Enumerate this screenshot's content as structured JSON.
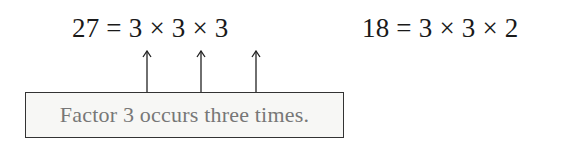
{
  "equations": [
    {
      "text": "27 = 3 × 3 × 3"
    },
    {
      "text": "18 = 3 × 3 × 2"
    }
  ],
  "annotation": {
    "label": "Factor 3 occurs three times.",
    "arrow_count": 3,
    "points_to": "each factor 3 in 27 = 3 × 3 × 3"
  },
  "colors": {
    "text": "#1a1a1a",
    "annotation_text": "#777777",
    "box_fill": "#f7f7f5",
    "box_border": "#333333"
  }
}
